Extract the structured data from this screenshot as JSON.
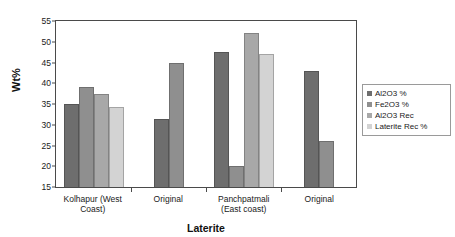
{
  "chart_data": {
    "type": "bar",
    "title": "",
    "xlabel": "Laterite",
    "ylabel": "Wt%",
    "ylim": [
      15,
      55
    ],
    "ytick_step": 5,
    "yticks": [
      55,
      50,
      45,
      40,
      35,
      30,
      25,
      20,
      15
    ],
    "grid": false,
    "legend_position": "right",
    "categories": [
      "Kolhapur (West Coast)",
      "Original",
      "Panchpatmali (East coast)",
      "Original"
    ],
    "series": [
      {
        "name": "Al2O3 %",
        "color": "#6e6e6e",
        "values": [
          35.0,
          31.5,
          47.5,
          43.0
        ]
      },
      {
        "name": "Fe2O3 %",
        "color": "#8f8f8f",
        "values": [
          39.0,
          45.0,
          20.0,
          26.0
        ]
      },
      {
        "name": "Al2O3 Rec",
        "color": "#a8a8a8",
        "values": [
          37.5,
          null,
          52.0,
          null
        ]
      },
      {
        "name": "Laterite Rec %",
        "color": "#d3d3d3",
        "values": [
          34.3,
          null,
          47.0,
          null
        ]
      }
    ]
  },
  "legend": {
    "items": [
      {
        "label": "Al2O3 %",
        "color": "#6e6e6e"
      },
      {
        "label": "Fe2O3 %",
        "color": "#8f8f8f"
      },
      {
        "label": "Al2O3 Rec",
        "color": "#a8a8a8"
      },
      {
        "label": "Laterite Rec %",
        "color": "#d3d3d3"
      }
    ]
  },
  "axes": {
    "y_title": "Wt%",
    "x_title": "Laterite"
  }
}
